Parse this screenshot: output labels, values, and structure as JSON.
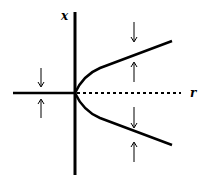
{
  "diagram": {
    "type": "pitchfork-bifurcation",
    "axes": {
      "vertical_label": "x",
      "horizontal_label": "r"
    },
    "branches": [
      {
        "name": "stable-zero-branch",
        "style": "solid",
        "region": "r<0"
      },
      {
        "name": "unstable-zero-branch",
        "style": "dashed",
        "region": "r>0"
      },
      {
        "name": "upper-stable-branch",
        "style": "solid",
        "region": "r>0"
      },
      {
        "name": "lower-stable-branch",
        "style": "solid",
        "region": "r>0"
      }
    ],
    "arrows": [
      {
        "position": "left-above",
        "direction": "down"
      },
      {
        "position": "left-below",
        "direction": "up"
      },
      {
        "position": "right-top",
        "direction": "down"
      },
      {
        "position": "right-upper-middle",
        "direction": "up"
      },
      {
        "position": "right-lower-middle",
        "direction": "down"
      },
      {
        "position": "right-bottom",
        "direction": "up"
      }
    ]
  }
}
